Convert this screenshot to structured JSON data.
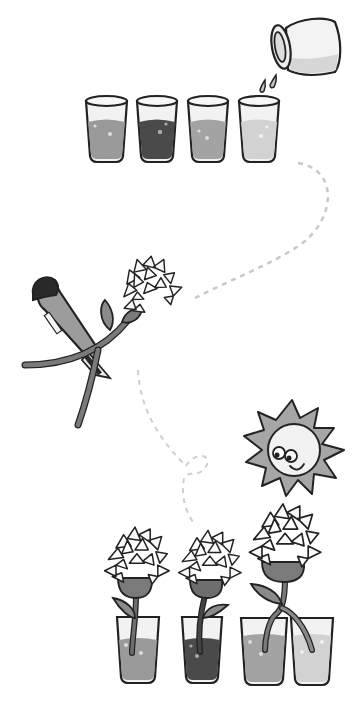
{
  "illustration": {
    "subject": "Colored water flower experiment",
    "steps": [
      {
        "name": "step-1-prepare-dye",
        "description": "Pour dye into four glasses of water"
      },
      {
        "name": "step-2-cut-stem",
        "description": "Cut the flower stem with a utility knife"
      },
      {
        "name": "step-3-sunlight",
        "description": "Place in sunlight"
      },
      {
        "name": "step-4-observe",
        "description": "Flowers in colored water; split stem across two glasses"
      }
    ]
  },
  "colors": {
    "outline": "#222222",
    "glass_fill": "#f2f2f2",
    "water_1": "#9a9a9a",
    "water_2": "#4a4a4a",
    "water_3": "#a3a3a3",
    "water_4": "#d2d2d2",
    "stem": "#6e6e6e",
    "leaf": "#8a8a8a",
    "knife_handle": "#9c9c9c",
    "knife_cap": "#2a2a2a",
    "sun": "#a6a6a6",
    "sun_face": "#f2f2f2",
    "dash": "#c8c8c8"
  }
}
